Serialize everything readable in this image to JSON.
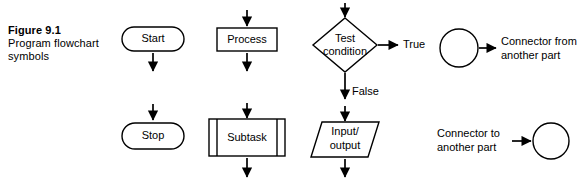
{
  "figure": {
    "number": "Figure 9.1",
    "title_line1": "Program flowchart",
    "title_line2": "symbols"
  },
  "colors": {
    "ink": "#000000",
    "background": "#ffffff"
  },
  "diagram": {
    "type": "flowchart-symbol-legend",
    "nodes": [
      {
        "id": "start",
        "label": "Start",
        "shape": "terminator"
      },
      {
        "id": "stop",
        "label": "Stop",
        "shape": "terminator"
      },
      {
        "id": "process",
        "label": "Process",
        "shape": "rectangle"
      },
      {
        "id": "subtask",
        "label": "Subtask",
        "shape": "predefined-process"
      },
      {
        "id": "test",
        "label_line1": "Test",
        "label_line2": "condition",
        "shape": "decision"
      },
      {
        "id": "inputoutput",
        "label_line1": "Input/",
        "label_line2": "output",
        "shape": "parallelogram"
      },
      {
        "id": "connector-from",
        "shape": "circle"
      },
      {
        "id": "connector-to",
        "shape": "circle"
      }
    ],
    "branch_labels": {
      "true": "True",
      "false": "False"
    },
    "connector_descriptions": {
      "from_line1": "Connector from",
      "from_line2": "another part",
      "to_line1": "Connector to",
      "to_line2": "another part"
    }
  }
}
